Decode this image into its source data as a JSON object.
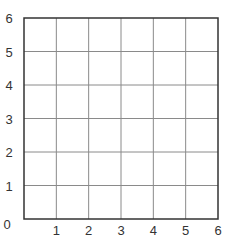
{
  "chart_data": {
    "type": "scatter",
    "title": "",
    "xlabel": "",
    "ylabel": "",
    "xlim": [
      0,
      6
    ],
    "ylim": [
      0,
      6
    ],
    "x_ticks": [
      "0",
      "1",
      "2",
      "3",
      "4",
      "5",
      "6"
    ],
    "y_ticks": [
      "0",
      "1",
      "2",
      "3",
      "4",
      "5",
      "6"
    ],
    "grid": true,
    "series": [],
    "legend": null
  },
  "colors": {
    "axis": "#333333",
    "grid": "#8a8a8a",
    "background": "#ffffff"
  }
}
